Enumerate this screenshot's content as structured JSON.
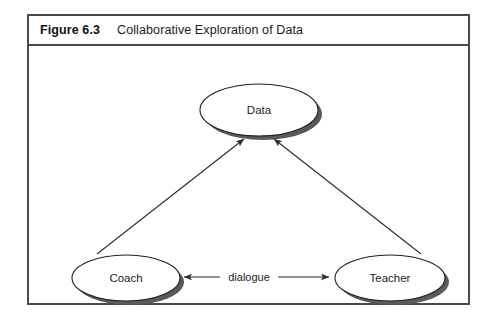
{
  "figure": {
    "number": "Figure 6.3",
    "title": "Collaborative Exploration of Data",
    "frame_color": "#4a4a4a",
    "background": "#ffffff"
  },
  "diagram": {
    "type": "node-link",
    "node_fill": "#ffffff",
    "node_stroke": "#1f1f1f",
    "shadow_color": "#5a5a5a",
    "edge_color": "#2b2b2b",
    "nodes": [
      {
        "id": "data",
        "label": "Data",
        "shape": "ellipse",
        "cx": 230,
        "cy": 64,
        "rx": 59,
        "ry": 26
      },
      {
        "id": "coach",
        "label": "Coach",
        "shape": "ellipse",
        "cx": 97,
        "cy": 232,
        "rx": 54,
        "ry": 23
      },
      {
        "id": "teacher",
        "label": "Teacher",
        "shape": "ellipse",
        "cx": 361,
        "cy": 232,
        "rx": 55,
        "ry": 23
      }
    ],
    "edges": [
      {
        "id": "coach-to-data",
        "from": "coach",
        "to": "data",
        "label": "",
        "arrow": "single",
        "direction": "up-right"
      },
      {
        "id": "teacher-to-data",
        "from": "teacher",
        "to": "data",
        "label": "",
        "arrow": "single",
        "direction": "up-left"
      },
      {
        "id": "coach-teacher-dialogue",
        "from": "coach",
        "to": "teacher",
        "label": "dialogue",
        "arrow": "double",
        "direction": "horizontal"
      }
    ]
  }
}
